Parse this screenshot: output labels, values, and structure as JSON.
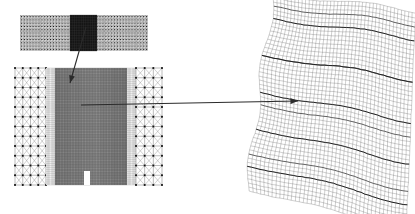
{
  "figure": {
    "title": "",
    "background_color": "#ffffff",
    "line_color": "#000000",
    "arrow_color": "#333333",
    "width": 415,
    "height": 214
  },
  "panels": [
    {
      "id": "coarse-strip",
      "name": "coarse-mesh-strip",
      "description": "Horizontal rectangular finite element mesh strip",
      "x": 20,
      "y": 15,
      "width": 128,
      "height": 36,
      "mesh": {
        "type": "quad",
        "cols": 44,
        "rows": 11,
        "fill": "#d8d8d8",
        "stroke": "#555555"
      },
      "highlight": {
        "name": "dark-refined-region",
        "x": 70,
        "y": 15,
        "width": 27,
        "height": 36,
        "fill": "#151515",
        "stroke": "#3a3a3a",
        "mesh": {
          "type": "quad",
          "cols": 12,
          "rows": 14
        }
      }
    },
    {
      "id": "fem-block",
      "name": "fem-block-mesh",
      "description": "Square finite element block with coarse edges, dense center and bottom notch",
      "x": 15,
      "y": 68,
      "width": 147,
      "height": 117,
      "zones": [
        {
          "name": "left-coarse-zone",
          "x": 15,
          "y": 68,
          "width": 31,
          "height": 117,
          "mesh": {
            "type": "quad-with-diagonals",
            "cols": 4,
            "rows": 12,
            "fill": "#ffffff",
            "stroke": "#666666",
            "nodes": true
          }
        },
        {
          "name": "left-transition-zone",
          "x": 46,
          "y": 68,
          "width": 9,
          "height": 117,
          "mesh": {
            "type": "quad",
            "cols": 7,
            "rows": 60,
            "fill": "#efefef",
            "stroke": "#888888"
          }
        },
        {
          "name": "center-dense-zone",
          "x": 55,
          "y": 68,
          "width": 72,
          "height": 117,
          "mesh": {
            "type": "quad",
            "cols": 46,
            "rows": 74,
            "fill": "#8f8f8f",
            "stroke": "#4a4a4a"
          }
        },
        {
          "name": "right-transition-zone",
          "x": 127,
          "y": 68,
          "width": 9,
          "height": 117,
          "mesh": {
            "type": "quad",
            "cols": 7,
            "rows": 60,
            "fill": "#efefef",
            "stroke": "#888888"
          }
        },
        {
          "name": "right-coarse-zone",
          "x": 136,
          "y": 68,
          "width": 26,
          "height": 117,
          "mesh": {
            "type": "quad-with-diagonals",
            "cols": 3,
            "rows": 12,
            "fill": "#ffffff",
            "stroke": "#666666",
            "nodes": true
          }
        }
      ],
      "notch": {
        "name": "bottom-notch-slot",
        "x": 84,
        "y": 171,
        "width": 6,
        "height": 14,
        "fill": "#ffffff"
      }
    },
    {
      "id": "draped-cloth",
      "name": "draped-cloth-mesh",
      "description": "Deformed draped cloth simulation mesh with wrinkle folds",
      "x": 255,
      "y": 5,
      "width": 155,
      "height": 205,
      "mesh": {
        "type": "quad-deformed",
        "cols": 40,
        "rows": 48,
        "fill": "#ffffff",
        "stroke": "#222222"
      },
      "folds": 5
    }
  ],
  "arrows": [
    {
      "name": "arrow-strip-to-block",
      "from_label": "dark-refined-region",
      "to_label": "fem-block-center",
      "x1": 86,
      "y1": 27,
      "x2": 70,
      "y2": 83,
      "color": "#2b2b2b",
      "head": "filled"
    },
    {
      "name": "arrow-block-to-cloth",
      "from_label": "fem-block-center",
      "to_label": "draped-cloth-wrinkle",
      "x1": 81,
      "y1": 105,
      "x2": 298,
      "y2": 101,
      "color": "#2b2b2b",
      "head": "filled"
    }
  ]
}
